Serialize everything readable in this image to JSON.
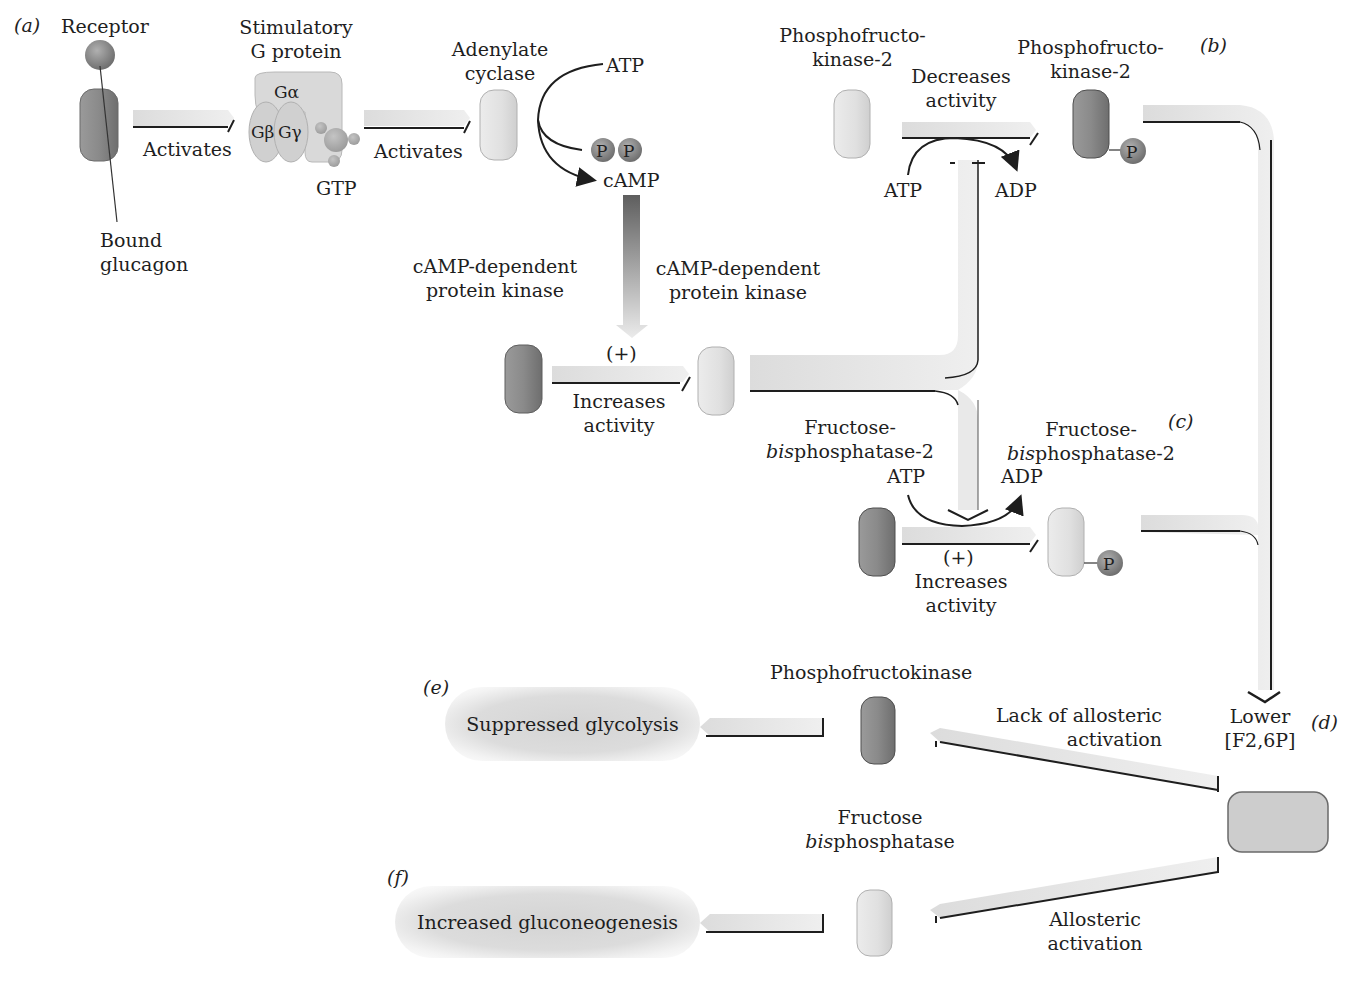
{
  "figure": {
    "panels": {
      "a": "(a)",
      "b": "(b)",
      "c": "(c)",
      "d": "(d)",
      "e": "(e)",
      "f": "(f)"
    },
    "panel_a": {
      "receptor_label": "Receptor",
      "bound_glucagon_label": [
        "Bound",
        "glucagon"
      ],
      "g_protein_label": [
        "Stimulatory",
        "G protein"
      ],
      "g_alpha": "Gα",
      "g_beta": "Gβ",
      "g_gamma": "Gγ",
      "gtp_label": "GTP",
      "activates_1": "Activates",
      "activates_2": "Activates",
      "adenylate_cyclase_label": [
        "Adenylate",
        "cyclase"
      ],
      "atp_label": "ATP",
      "ppi": [
        "P",
        "P"
      ],
      "camp_label": "cAMP",
      "pka_left_label": [
        "cAMP-dependent",
        "protein kinase"
      ],
      "pka_right_label": [
        "cAMP-dependent",
        "protein kinase"
      ],
      "plus_sign": "(+)",
      "increases_activity": [
        "Increases",
        "activity"
      ]
    },
    "panel_b": {
      "pfk2_left_label": [
        "Phosphofructo-",
        "kinase-2"
      ],
      "pfk2_right_label": [
        "Phosphofructo-",
        "kinase-2"
      ],
      "decreases_activity": [
        "Decreases",
        "activity"
      ],
      "atp_label": "ATP",
      "adp_label": "ADP",
      "phosphate": "P"
    },
    "panel_c": {
      "fbpase2_left_label": {
        "line1": "Fructose-",
        "italic": "bis",
        "rest": "phosphatase-2"
      },
      "fbpase2_right_label": {
        "line1": "Fructose-",
        "italic": "bis",
        "rest": "phosphatase-2"
      },
      "atp_label": "ATP",
      "adp_label": "ADP",
      "plus_sign": "(+)",
      "increases_activity": [
        "Increases",
        "activity"
      ],
      "phosphate": "P"
    },
    "panel_d": {
      "lower_f26p": [
        "Lower",
        "[F2,6P]"
      ],
      "lack_allosteric": [
        "Lack of allosteric",
        "activation"
      ],
      "allosteric_activation": [
        "Allosteric",
        "activation"
      ]
    },
    "panel_e": {
      "pfk_label": "Phosphofructokinase",
      "outcome": "Suppressed glycolysis"
    },
    "panel_f": {
      "fbpase_label": {
        "line1": "Fructose",
        "italic": "bis",
        "rest": "phosphatase"
      },
      "outcome": "Increased gluconeogenesis"
    },
    "colors": {
      "dark_protein": "#8a8a8a",
      "light_protein": "#e2e2e2",
      "arrow_fill": "#e6e6e6",
      "arrow_edge": "#1e1e1e",
      "phosphate_ball": "#8c8c8c"
    }
  }
}
